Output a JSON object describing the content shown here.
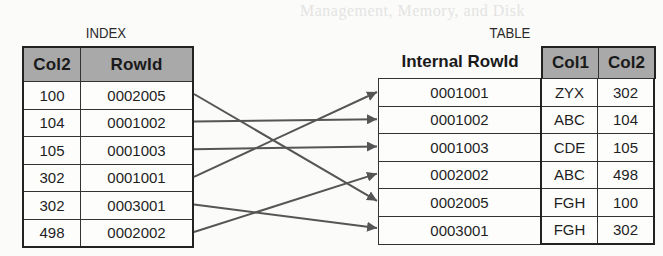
{
  "background_text": "Management, Memory, and Disk",
  "index": {
    "title": "INDEX",
    "headers": [
      "Col2",
      "RowId"
    ],
    "rows": [
      {
        "col2": "100",
        "rowid": "0002005"
      },
      {
        "col2": "104",
        "rowid": "0001002"
      },
      {
        "col2": "105",
        "rowid": "0001003"
      },
      {
        "col2": "302",
        "rowid": "0001001"
      },
      {
        "col2": "302",
        "rowid": "0003001"
      },
      {
        "col2": "498",
        "rowid": "0002002"
      }
    ]
  },
  "table": {
    "title": "TABLE",
    "headers": [
      "Internal RowId",
      "Col1",
      "Col2"
    ],
    "rows": [
      {
        "rowid": "0001001",
        "col1": "ZYX",
        "col2": "302"
      },
      {
        "rowid": "0001002",
        "col1": "ABC",
        "col2": "104"
      },
      {
        "rowid": "0001003",
        "col1": "CDE",
        "col2": "105"
      },
      {
        "rowid": "0002002",
        "col1": "ABC",
        "col2": "498"
      },
      {
        "rowid": "0002005",
        "col1": "FGH",
        "col2": "100"
      },
      {
        "rowid": "0003001",
        "col1": "FGH",
        "col2": "302"
      }
    ]
  },
  "arrows": [
    {
      "from_index_row": 0,
      "to_table_row": 4
    },
    {
      "from_index_row": 1,
      "to_table_row": 1
    },
    {
      "from_index_row": 2,
      "to_table_row": 2
    },
    {
      "from_index_row": 3,
      "to_table_row": 0
    },
    {
      "from_index_row": 4,
      "to_table_row": 5
    },
    {
      "from_index_row": 5,
      "to_table_row": 3
    }
  ],
  "colors": {
    "header_fill": "#a9a9a9",
    "line": "#222222",
    "arrow": "#555555"
  }
}
